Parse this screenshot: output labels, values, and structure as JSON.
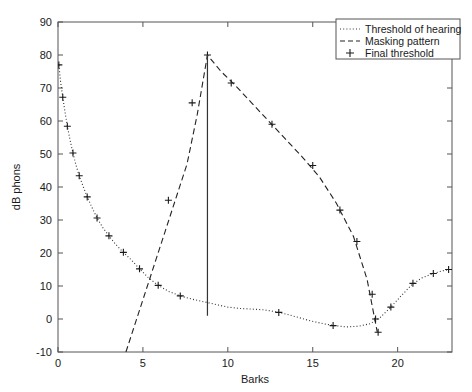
{
  "chart_data": {
    "type": "line",
    "title": "",
    "xlabel": "Barks",
    "ylabel": "dB phons",
    "xlim": [
      0,
      23.2
    ],
    "ylim": [
      -10,
      90
    ],
    "xticks": [
      0,
      5,
      10,
      15,
      20
    ],
    "yticks": [
      -10,
      0,
      10,
      20,
      30,
      40,
      50,
      60,
      70,
      80,
      90
    ],
    "grid": false,
    "legend_position": "top-right",
    "series": [
      {
        "name": "Threshold of hearing",
        "style": "dotted",
        "color": "#333333",
        "points": [
          [
            0.05,
            77.0
          ],
          [
            0.15,
            72.0
          ],
          [
            0.28,
            67.2
          ],
          [
            0.42,
            62.5
          ],
          [
            0.55,
            58.4
          ],
          [
            0.72,
            54.0
          ],
          [
            0.88,
            50.3
          ],
          [
            1.05,
            46.8
          ],
          [
            1.25,
            43.4
          ],
          [
            1.48,
            40.2
          ],
          [
            1.72,
            37.0
          ],
          [
            2.0,
            33.8
          ],
          [
            2.3,
            30.6
          ],
          [
            2.65,
            27.6
          ],
          [
            3.0,
            25.2
          ],
          [
            3.4,
            22.6
          ],
          [
            3.85,
            20.2
          ],
          [
            4.3,
            18.0
          ],
          [
            4.8,
            15.2
          ],
          [
            5.3,
            12.6
          ],
          [
            5.9,
            10.2
          ],
          [
            6.5,
            8.4
          ],
          [
            7.2,
            7.0
          ],
          [
            7.9,
            6.0
          ],
          [
            8.6,
            5.2
          ],
          [
            9.3,
            4.4
          ],
          [
            10.0,
            3.6
          ],
          [
            10.7,
            3.2
          ],
          [
            11.4,
            3.0
          ],
          [
            12.1,
            2.8
          ],
          [
            12.8,
            2.2
          ],
          [
            13.5,
            1.4
          ],
          [
            14.2,
            0.4
          ],
          [
            14.9,
            -0.6
          ],
          [
            15.6,
            -1.4
          ],
          [
            16.3,
            -2.0
          ],
          [
            17.0,
            -2.4
          ],
          [
            17.7,
            -2.2
          ],
          [
            18.4,
            -1.4
          ],
          [
            19.0,
            0.6
          ],
          [
            19.6,
            3.6
          ],
          [
            20.2,
            7.0
          ],
          [
            20.8,
            10.2
          ],
          [
            21.4,
            12.4
          ],
          [
            22.0,
            13.6
          ],
          [
            22.5,
            14.4
          ],
          [
            23.0,
            15.0
          ]
        ]
      },
      {
        "name": "Masking pattern",
        "style": "dashed",
        "color": "#222222",
        "points": [
          [
            4.0,
            -10.0
          ],
          [
            4.6,
            -0.5
          ],
          [
            5.2,
            9.0
          ],
          [
            5.8,
            18.5
          ],
          [
            6.4,
            28.0
          ],
          [
            7.0,
            37.5
          ],
          [
            7.6,
            47.0
          ],
          [
            8.2,
            62.0
          ],
          [
            8.8,
            80.0
          ],
          [
            9.6,
            75.0
          ],
          [
            10.4,
            71.0
          ],
          [
            11.4,
            65.5
          ],
          [
            12.4,
            60.0
          ],
          [
            13.4,
            54.5
          ],
          [
            14.4,
            49.0
          ],
          [
            15.4,
            43.0
          ],
          [
            16.4,
            35.0
          ],
          [
            17.4,
            25.0
          ],
          [
            18.2,
            12.0
          ],
          [
            18.8,
            -4.0
          ]
        ]
      },
      {
        "name": "Final threshold",
        "style": "markers",
        "marker": "+",
        "color": "#1a1a1a",
        "points": [
          [
            0.05,
            77.0
          ],
          [
            0.28,
            67.2
          ],
          [
            0.55,
            58.4
          ],
          [
            0.88,
            50.3
          ],
          [
            1.25,
            43.4
          ],
          [
            1.72,
            37.0
          ],
          [
            2.3,
            30.6
          ],
          [
            3.0,
            25.2
          ],
          [
            3.85,
            20.2
          ],
          [
            4.8,
            15.2
          ],
          [
            5.9,
            10.2
          ],
          [
            7.2,
            7.0
          ],
          [
            6.5,
            36.0
          ],
          [
            7.9,
            65.5
          ],
          [
            8.8,
            80.0
          ],
          [
            10.2,
            71.5
          ],
          [
            12.6,
            59.0
          ],
          [
            15.0,
            46.5
          ],
          [
            16.6,
            33.0
          ],
          [
            17.6,
            23.5
          ],
          [
            18.5,
            7.5
          ],
          [
            18.85,
            -4.0
          ],
          [
            13.0,
            2.0
          ],
          [
            16.2,
            -2.0
          ],
          [
            18.7,
            0.0
          ],
          [
            19.6,
            3.6
          ],
          [
            20.9,
            10.8
          ],
          [
            22.1,
            13.8
          ],
          [
            23.0,
            15.0
          ]
        ]
      }
    ],
    "annotations": [
      {
        "type": "vertical-line",
        "name": "masker-tone-line",
        "x": 8.8,
        "y_from": 1.0,
        "y_to": 80.0
      }
    ],
    "legend": [
      {
        "label": "Threshold of hearing",
        "style": "dotted"
      },
      {
        "label": "Masking pattern",
        "style": "dashed"
      },
      {
        "label": "Final threshold",
        "style": "marker-plus"
      }
    ]
  }
}
